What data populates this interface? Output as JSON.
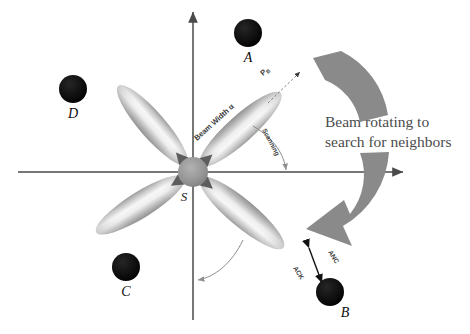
{
  "figure": {
    "background_color": "#ffffff"
  },
  "axes": {
    "vertical_axis_name": "vertical-axis",
    "horizontal_axis_name": "horizontal-axis",
    "axis_color": "#4a4a4a"
  },
  "center_node": {
    "label": "S",
    "color": "#8f8f8f",
    "x": 193,
    "y": 172,
    "r": 15
  },
  "neighbor_nodes": [
    {
      "label": "A",
      "x": 248,
      "y": 33,
      "r": 14,
      "color": "#0a0a0a",
      "label_dx": 0,
      "label_dy": 29
    },
    {
      "label": "B",
      "x": 330,
      "y": 292,
      "r": 14,
      "color": "#0a0a0a",
      "label_dx": 13,
      "label_dy": 25
    },
    {
      "label": "C",
      "x": 126,
      "y": 267,
      "r": 14,
      "color": "#0a0a0a",
      "label_dx": 0,
      "label_dy": 29
    },
    {
      "label": "D",
      "x": 73,
      "y": 89,
      "r": 14,
      "color": "#0a0a0a",
      "label_dx": 0,
      "label_dy": 29
    }
  ],
  "beam_lobes": [
    {
      "name": "lobe-upper-right",
      "angle": -42,
      "length": 104
    },
    {
      "name": "lobe-upper-left",
      "angle": -131,
      "length": 100
    },
    {
      "name": "lobe-lower-left",
      "angle": 148,
      "length": 100
    },
    {
      "name": "lobe-lower-right",
      "angle": 40,
      "length": 104
    }
  ],
  "annotations": {
    "beam_width": "Beam Width α",
    "scanning": "Scanning",
    "probe": "P",
    "probe_sub": "B",
    "anc": "ANC",
    "ack": "ACK"
  },
  "caption": {
    "line1": "Beam rotating to",
    "line2": "search for neighbors",
    "text_color": "#4c4c4c"
  },
  "rotation_arrows": {
    "top_name": "rotation-arrow-top",
    "bottom_name": "rotation-arrow-bottom",
    "color": "#8a8a8a"
  }
}
